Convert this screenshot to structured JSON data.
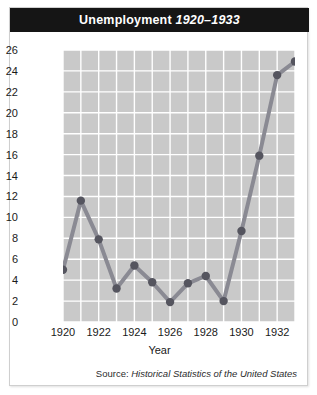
{
  "figure": {
    "title_main": "Unemployment",
    "title_years": "1920–1933",
    "source_prefix": "Source:",
    "source_title": "Historical Statistics of the United States"
  },
  "colors": {
    "title_bar": "#151515",
    "title_text": "#ffffff",
    "plot_background": "#c9c9c9",
    "gridline": "#ffffff",
    "line": "#8a8a93",
    "marker": "#55555f",
    "card_border": "#cfcfcf"
  },
  "chart_data": {
    "type": "line",
    "title": "Unemployment 1920–1933",
    "xlabel": "Year",
    "ylabel": "Percent of Work Force",
    "xlim": [
      1920,
      1933
    ],
    "ylim": [
      0,
      26
    ],
    "ytick_step": 2,
    "xtick_step": 2,
    "grid": true,
    "legend": "none",
    "x": [
      1920,
      1921,
      1922,
      1923,
      1924,
      1925,
      1926,
      1927,
      1928,
      1929,
      1930,
      1931,
      1932,
      1933
    ],
    "values": [
      5.0,
      11.6,
      7.9,
      3.2,
      5.4,
      3.8,
      1.9,
      3.7,
      4.4,
      2.0,
      8.7,
      15.9,
      23.6,
      24.9
    ],
    "ytick_labels": [
      "0",
      "2",
      "4",
      "6",
      "8",
      "10",
      "12",
      "14",
      "16",
      "18",
      "20",
      "22",
      "24",
      "26"
    ],
    "xtick_labels": [
      "1920",
      "1922",
      "1924",
      "1926",
      "1928",
      "1930",
      "1932"
    ],
    "xtick_values": [
      1920,
      1922,
      1924,
      1926,
      1928,
      1930,
      1932
    ]
  }
}
